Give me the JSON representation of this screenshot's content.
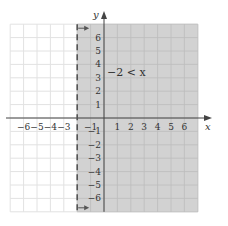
{
  "chart_data": {
    "type": "inequality-graph",
    "title": "",
    "inequality": "−2 < x",
    "boundary": {
      "x": -2,
      "style": "dashed",
      "included": false
    },
    "shaded_region": "x > -2",
    "xlabel": "x",
    "ylabel": "y",
    "xlim": [
      -7,
      7
    ],
    "ylim": [
      -7,
      7
    ],
    "grid": true,
    "x_ticks": [
      -6,
      -5,
      -4,
      -3,
      -1,
      1,
      2,
      3,
      4,
      5,
      6
    ],
    "x_tick_labels": [
      "−6",
      "−5",
      "−4",
      "−3",
      "−1",
      "1",
      "2",
      "3",
      "4",
      "5",
      "6"
    ],
    "y_ticks": [
      6,
      5,
      4,
      3,
      2,
      1,
      -1,
      -2,
      -3,
      -4,
      -5,
      -6
    ],
    "y_tick_labels": [
      "6",
      "5",
      "4",
      "3",
      "2",
      "1",
      "−1",
      "−2",
      "−3",
      "−4",
      "−5",
      "−6"
    ],
    "arrows": [
      "boundary arrow top pointing right",
      "boundary arrow bottom pointing right"
    ]
  },
  "colors": {
    "shade": "#d2d2d2",
    "grid_shaded": "#bcbcbc",
    "grid_unshaded": "#e2e2e2",
    "axis": "#444444",
    "boundary": "#555555"
  },
  "labels": {
    "x_axis": "x",
    "y_axis": "y",
    "inequality": "−2 < x"
  }
}
